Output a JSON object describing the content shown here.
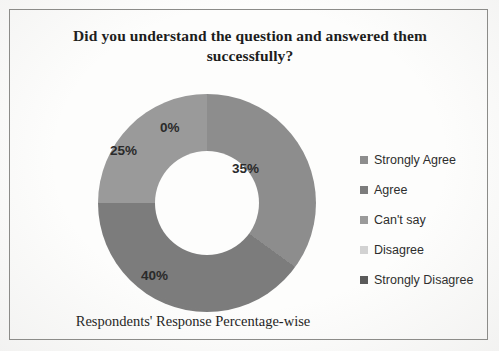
{
  "chart_data": {
    "type": "pie",
    "variant": "donut",
    "title": "Did you understand the question and answered them successfully?",
    "caption": "Respondents' Response Percentage-wise",
    "categories": [
      "Strongly Agree",
      "Agree",
      "Can't say",
      "Disagree",
      "Strongly Disagree"
    ],
    "values": [
      35,
      40,
      25,
      0,
      0
    ],
    "value_labels": [
      "35%",
      "40%",
      "25%",
      "0%",
      "0%"
    ],
    "colors": [
      "#8d8d8d",
      "#7c7c7c",
      "#9a9a9a",
      "#d2d2d2",
      "#5a5a5a"
    ],
    "unit": "%",
    "total": 100,
    "start_angle": 0,
    "legend_position": "right",
    "grid": false,
    "xlabel": "",
    "ylabel": ""
  },
  "labels": {
    "zero_top": "0%",
    "share_right": "35%",
    "share_bottom": "40%",
    "share_left": "25%",
    "zero_hidden": "0%"
  },
  "legend": {
    "items": [
      {
        "label": "Strongly Agree",
        "color": "#8d8d8d",
        "value": "35%"
      },
      {
        "label": "Agree",
        "color": "#7c7c7c",
        "value": "40%"
      },
      {
        "label": "Can't say",
        "color": "#9a9a9a",
        "value": "25%"
      },
      {
        "label": "Disagree",
        "color": "#d2d2d2",
        "value": "0%"
      },
      {
        "label": "Strongly Disagree",
        "color": "#5a5a5a",
        "value": "0%"
      }
    ]
  }
}
